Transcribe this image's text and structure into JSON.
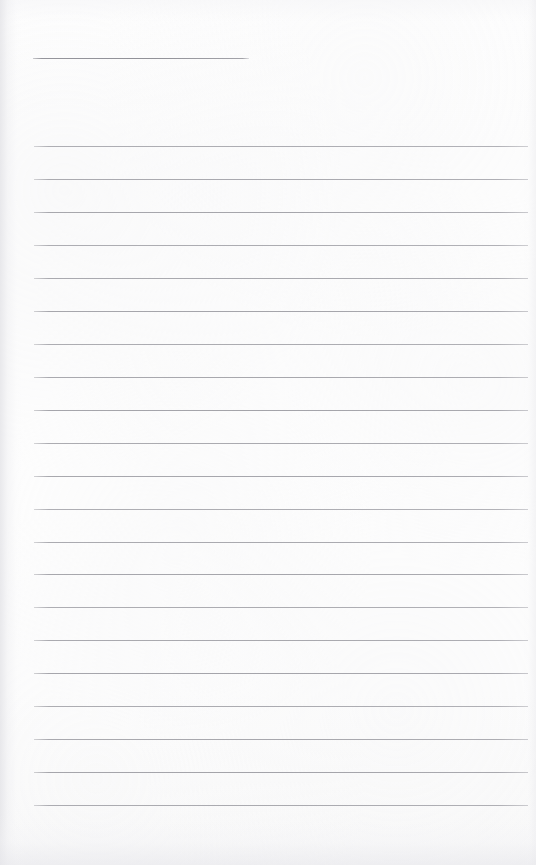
{
  "page": {
    "kind": "scanned-lined-notebook-page",
    "width": 536,
    "height": 865,
    "background_color": "#fdfdfd",
    "rule_color": "#a9a9ae",
    "text_content": "",
    "note": "Blank ruled page - no handwriting, no printed text"
  },
  "layout": {
    "left_margin": 34,
    "right_edge": 528,
    "line_spacing": 33,
    "first_rule_y": 58,
    "body_first_rule_y": 146,
    "last_rule_y": 805
  },
  "rules": {
    "header_rule": {
      "label": "header-rule",
      "y": 58,
      "x_start": 33,
      "x_end": 249,
      "width": 216,
      "style": "short"
    },
    "body_rules": [
      {
        "y": 146,
        "x_start": 34,
        "x_end": 528
      },
      {
        "y": 179,
        "x_start": 34,
        "x_end": 528
      },
      {
        "y": 212,
        "x_start": 34,
        "x_end": 528
      },
      {
        "y": 245,
        "x_start": 34,
        "x_end": 528
      },
      {
        "y": 278,
        "x_start": 34,
        "x_end": 528
      },
      {
        "y": 311,
        "x_start": 34,
        "x_end": 528
      },
      {
        "y": 344,
        "x_start": 34,
        "x_end": 528
      },
      {
        "y": 377,
        "x_start": 34,
        "x_end": 528
      },
      {
        "y": 410,
        "x_start": 34,
        "x_end": 528
      },
      {
        "y": 443,
        "x_start": 34,
        "x_end": 528
      },
      {
        "y": 476,
        "x_start": 34,
        "x_end": 528
      },
      {
        "y": 509,
        "x_start": 34,
        "x_end": 528
      },
      {
        "y": 542,
        "x_start": 34,
        "x_end": 528
      },
      {
        "y": 574,
        "x_start": 34,
        "x_end": 528
      },
      {
        "y": 607,
        "x_start": 34,
        "x_end": 528
      },
      {
        "y": 640,
        "x_start": 34,
        "x_end": 528
      },
      {
        "y": 673,
        "x_start": 34,
        "x_end": 528
      },
      {
        "y": 706,
        "x_start": 34,
        "x_end": 528
      },
      {
        "y": 739,
        "x_start": 34,
        "x_end": 528
      },
      {
        "y": 772,
        "x_start": 34,
        "x_end": 528
      },
      {
        "y": 805,
        "x_start": 34,
        "x_end": 528
      }
    ]
  }
}
